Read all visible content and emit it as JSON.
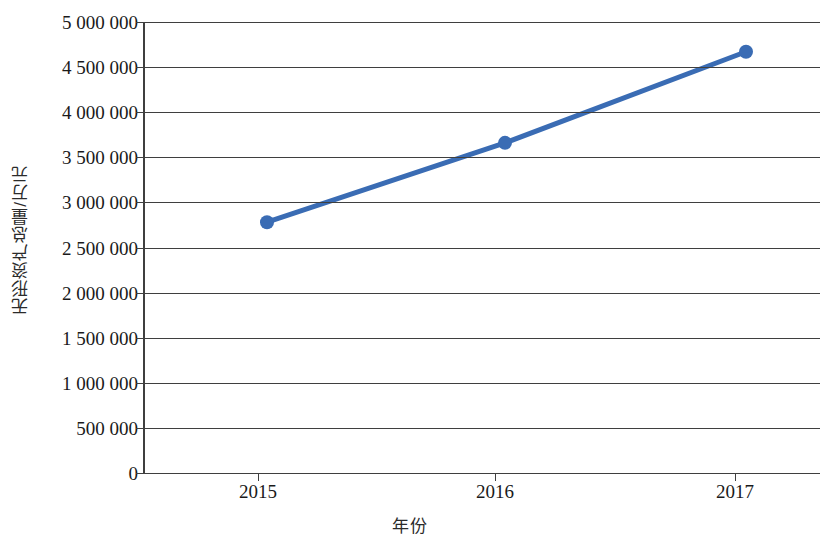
{
  "chart_data": {
    "type": "line",
    "title": "",
    "xlabel": "年份",
    "ylabel": "无形资产总量/万元",
    "categories": [
      "2015",
      "2016",
      "2017"
    ],
    "values": [
      2780000,
      3660000,
      4670000
    ],
    "series": [
      {
        "name": "无形资产总量",
        "values": [
          2780000,
          3660000,
          4670000
        ],
        "color": "#3a6cb4",
        "marker": "circle",
        "line_width": 5
      }
    ],
    "ylim": [
      0,
      5000000
    ],
    "y_ticks": [
      0,
      500000,
      1000000,
      1500000,
      2000000,
      2500000,
      3000000,
      3500000,
      4000000,
      4500000,
      5000000
    ],
    "y_tick_labels": [
      "0",
      "500 000",
      "1 000 000",
      "1 500 000",
      "2 000 000",
      "2 500 000",
      "3 000 000",
      "3 500 000",
      "4 000 000",
      "4 500 000",
      "5 000 000"
    ],
    "x_tick_labels": [
      "2015",
      "2016",
      "2017"
    ],
    "grid": {
      "horizontal": true,
      "vertical": false,
      "color": "#3f3f3f"
    },
    "legend": {
      "visible": false,
      "position": "none"
    },
    "axis_color": "#3f3f3f",
    "background_color": "#ffffff"
  }
}
